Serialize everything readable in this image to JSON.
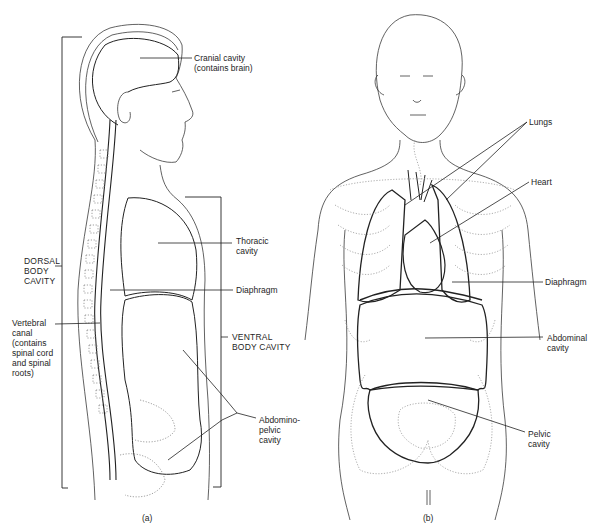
{
  "figure": {
    "panel_a": {
      "caption": "(a)",
      "labels": {
        "cranial": "Cranial cavity\n(contains brain)",
        "thoracic": "Thoracic\ncavity",
        "dorsal": "DORSAL\nBODY\nCAVITY",
        "diaphragm": "Diaphragm",
        "vertebral": "Vertebral\ncanal\n(contains\nspinal cord\nand spinal\nroots)",
        "ventral": "VENTRAL\nBODY CAVITY",
        "abdominopelvic": "Abdomino-\npelvic\ncavity"
      }
    },
    "panel_b": {
      "caption": "(b)",
      "labels": {
        "lungs": "Lungs",
        "heart": "Heart",
        "diaphragm": "Diaphragm",
        "abdominal": "Abdominal\ncavity",
        "pelvic": "Pelvic\ncavity"
      }
    },
    "colors": {
      "ink": "#1e1e1e",
      "faint": "#8a8a8a",
      "background": "#ffffff"
    }
  }
}
